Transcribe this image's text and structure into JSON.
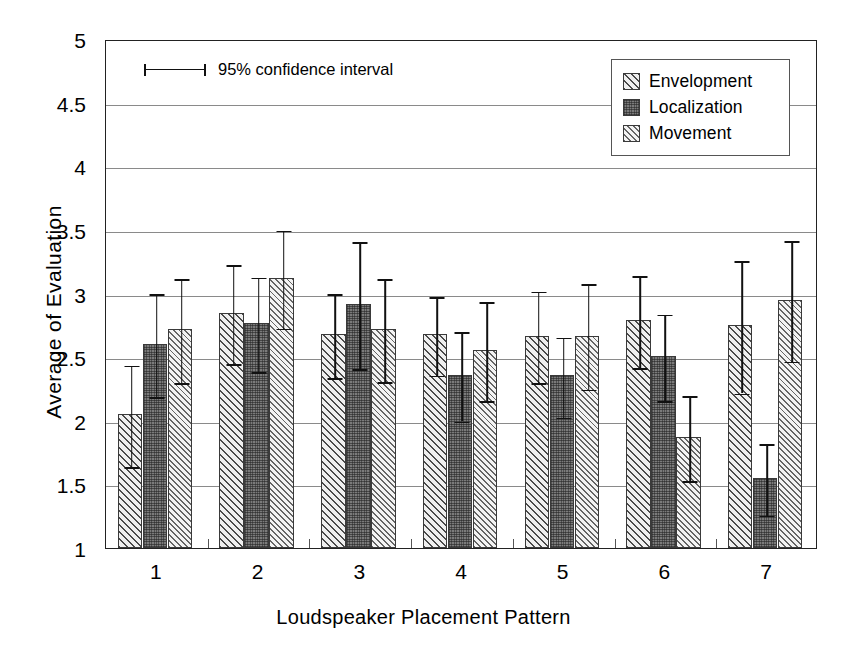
{
  "chart_data": {
    "type": "bar",
    "title": "",
    "xlabel": "Loudspeaker Placement Pattern",
    "ylabel": "Average of Evaluation",
    "categories": [
      "1",
      "2",
      "3",
      "4",
      "5",
      "6",
      "7"
    ],
    "ylim": [
      1,
      5
    ],
    "yticks": [
      1,
      1.5,
      2,
      2.5,
      3,
      3.5,
      4,
      4.5,
      5
    ],
    "ytick_labels": [
      "1",
      "1.5",
      "2",
      "2.5",
      "3",
      "3.5",
      "4",
      "4.5",
      "5"
    ],
    "grid": true,
    "legend_position": "top-right",
    "error_bar_note": "95% confidence interval",
    "series": [
      {
        "name": "Envelopment",
        "pattern": "diagonal-hatch-light",
        "values": [
          2.05,
          2.85,
          2.68,
          2.68,
          2.67,
          2.79,
          2.75
        ],
        "err_low": [
          1.65,
          2.46,
          2.35,
          2.37,
          2.31,
          2.43,
          2.23
        ],
        "err_high": [
          2.45,
          3.24,
          3.01,
          2.99,
          3.03,
          3.15,
          3.27
        ]
      },
      {
        "name": "Localization",
        "pattern": "cross-hatch-dark",
        "values": [
          2.6,
          2.77,
          2.92,
          2.36,
          2.36,
          2.51,
          1.55
        ],
        "err_low": [
          2.2,
          2.4,
          2.42,
          2.01,
          2.04,
          2.17,
          1.27
        ],
        "err_high": [
          3.01,
          3.14,
          3.42,
          2.71,
          2.67,
          2.85,
          1.83
        ]
      },
      {
        "name": "Movement",
        "pattern": "diagonal-hatch-medium",
        "values": [
          2.72,
          3.12,
          2.72,
          2.56,
          2.67,
          1.87,
          2.95
        ],
        "err_low": [
          2.31,
          2.74,
          2.32,
          2.17,
          2.26,
          1.54,
          2.48
        ],
        "err_high": [
          3.13,
          3.51,
          3.13,
          2.95,
          3.09,
          2.21,
          3.43
        ]
      }
    ]
  },
  "legend": {
    "items": [
      {
        "label": "Envelopment"
      },
      {
        "label": "Localization"
      },
      {
        "label": "Movement"
      }
    ]
  },
  "annotation": {
    "ci_label": "95% confidence interval"
  },
  "colors": {
    "axis": "#222222",
    "grid": "#8a8a8a",
    "bar_dark": "#7b7b7b",
    "bar_light": "#efefef",
    "error_bar": "#111111"
  }
}
